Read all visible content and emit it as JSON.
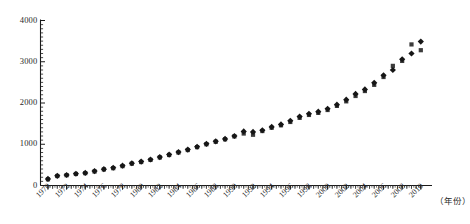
{
  "chart_data": {
    "type": "scatter",
    "title": "",
    "subtitle": "",
    "xlabel": "（年份）",
    "ylabel": "",
    "xlim": [
      1969.2,
      2011.2
    ],
    "ylim": [
      0,
      4000
    ],
    "grid": false,
    "legend_position": "none",
    "y_ticks": [
      0,
      1000,
      2000,
      3000,
      4000
    ],
    "y_tick_labels": [
      "0",
      "1000",
      "2000",
      "3000",
      "4000"
    ],
    "y_minor_tick_interval": 100,
    "x_ticks": [
      1970,
      1972,
      1974,
      1976,
      1978,
      1980,
      1982,
      1984,
      1986,
      1988,
      1990,
      1992,
      1994,
      1996,
      1998,
      2000,
      2002,
      2004,
      2006,
      2008,
      2010
    ],
    "x_tick_labels": [
      "1970",
      "1972",
      "1974",
      "1976",
      "1978",
      "1980",
      "1982",
      "1984",
      "1986",
      "1988",
      "1990",
      "1992",
      "1994",
      "1996",
      "1998",
      "2000",
      "2002",
      "2004",
      "2006",
      "2008",
      "2010"
    ],
    "x_minor_tick_interval": 0.5,
    "x": [
      1970,
      1971,
      1972,
      1973,
      1974,
      1975,
      1976,
      1977,
      1978,
      1979,
      1980,
      1981,
      1982,
      1983,
      1984,
      1985,
      1986,
      1987,
      1988,
      1989,
      1990,
      1991,
      1992,
      1993,
      1994,
      1995,
      1996,
      1997,
      1998,
      1999,
      2000,
      2001,
      2002,
      2003,
      2004,
      2005,
      2006,
      2007,
      2008,
      2009,
      2010
    ],
    "series": [
      {
        "name": "series-squares",
        "marker": "square",
        "color": "#3c3c3c",
        "values": [
          150,
          230,
          250,
          280,
          300,
          340,
          390,
          420,
          470,
          530,
          570,
          620,
          680,
          740,
          800,
          860,
          930,
          1000,
          1060,
          1120,
          1190,
          1260,
          1230,
          1320,
          1400,
          1460,
          1540,
          1640,
          1710,
          1760,
          1830,
          1930,
          2040,
          2170,
          2290,
          2440,
          2630,
          2900,
          3020,
          3420,
          3280
        ]
      },
      {
        "name": "series-diamonds",
        "marker": "diamond",
        "color": "#161616",
        "values": [
          160,
          235,
          255,
          285,
          305,
          350,
          395,
          430,
          480,
          540,
          580,
          630,
          690,
          750,
          810,
          870,
          940,
          1010,
          1070,
          1130,
          1200,
          1310,
          1300,
          1340,
          1420,
          1480,
          1570,
          1670,
          1740,
          1790,
          1860,
          1960,
          2080,
          2220,
          2330,
          2490,
          2670,
          2800,
          3060,
          3200,
          3490
        ]
      }
    ]
  }
}
